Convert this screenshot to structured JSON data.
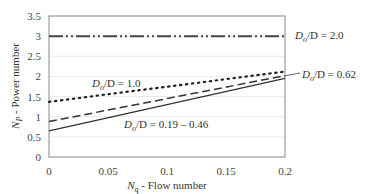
{
  "chart_data": {
    "type": "line",
    "title": "",
    "xlabel": "N_q - Flow number",
    "xlabel_main": "N",
    "xlabel_sub": "q",
    "xlabel_rest": " - Flow number",
    "ylabel": "N_P - Power number",
    "ylabel_main": "N",
    "ylabel_sub": "P",
    "ylabel_rest": " - Power number",
    "xlim": [
      0,
      0.2
    ],
    "ylim": [
      0,
      3.5
    ],
    "xticks": [
      0,
      0.05,
      0.1,
      0.15,
      0.2
    ],
    "xtick_labels": [
      "0",
      "0.05",
      "0.1",
      "0.15",
      "0.2"
    ],
    "yticks": [
      0,
      0.5,
      1,
      1.5,
      2,
      2.5,
      3,
      3.5
    ],
    "ytick_labels": [
      "0",
      "0.5",
      "1",
      "1.5",
      "2",
      "2.5",
      "3",
      "3.5"
    ],
    "grid": true,
    "series": [
      {
        "name": "Do/D = 2.0",
        "style": "dash-dot-dot",
        "x": [
          0,
          0.2
        ],
        "y": [
          3.0,
          3.0
        ]
      },
      {
        "name": "Do/D = 1.0",
        "style": "dotted",
        "x": [
          0,
          0.2
        ],
        "y": [
          1.37,
          2.12
        ]
      },
      {
        "name": "Do/D = 0.62",
        "style": "dashed",
        "x": [
          0,
          0.2
        ],
        "y": [
          0.88,
          2.02
        ]
      },
      {
        "name": "Do/D = 0.19 - 0.46",
        "style": "solid",
        "x": [
          0,
          0.2
        ],
        "y": [
          0.65,
          1.95
        ]
      }
    ],
    "annotations": [
      {
        "text_main": "D",
        "text_sub": "o",
        "text_rest": "/D = 2.0"
      },
      {
        "text_main": "D",
        "text_sub": "o",
        "text_rest": "/D = 1.0"
      },
      {
        "text_main": "D",
        "text_sub": "o",
        "text_rest": "/D = 0.62"
      },
      {
        "text_main": "D",
        "text_sub": "o",
        "text_rest": "/D = 0.19 – 0.46"
      }
    ]
  }
}
